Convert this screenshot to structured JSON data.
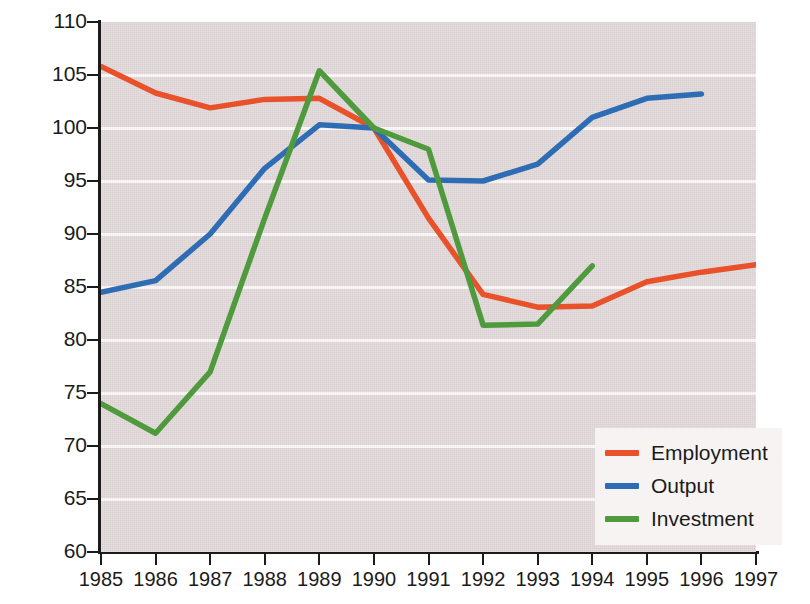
{
  "chart_data": {
    "type": "line",
    "title": "",
    "subtitle": "",
    "xlabel": "",
    "ylabel": "1990=100",
    "x": [
      1985,
      1986,
      1987,
      1988,
      1989,
      1990,
      1991,
      1992,
      1993,
      1994,
      1995,
      1996,
      1997
    ],
    "xtick_labels": [
      "1985",
      "1986",
      "1987",
      "1988",
      "1989",
      "1990",
      "1991",
      "1992",
      "1993",
      "1994",
      "1995",
      "1996",
      "1997"
    ],
    "ytick_labels": [
      "110",
      "105",
      "100",
      "95",
      "90",
      "85",
      "80",
      "75",
      "70",
      "65",
      "60"
    ],
    "yticks": [
      110,
      105,
      100,
      95,
      90,
      85,
      80,
      75,
      70,
      65,
      60
    ],
    "ylim": [
      60,
      110
    ],
    "xlim": [
      1985,
      1997
    ],
    "grid": true,
    "grid_axis": "y",
    "legend_position": "bottom-right",
    "plot_background": "#e2dada",
    "gridline_color": "#fbf8f8",
    "series": [
      {
        "name": "Employment",
        "color": "#e8512a",
        "x": [
          1985,
          1986,
          1987,
          1988,
          1989,
          1990,
          1991,
          1992,
          1993,
          1994,
          1995,
          1996,
          1997
        ],
        "values": [
          105.8,
          103.3,
          101.9,
          102.7,
          102.8,
          100.0,
          91.5,
          84.3,
          83.1,
          83.2,
          85.5,
          86.4,
          87.1
        ]
      },
      {
        "name": "Output",
        "color": "#2e6db4",
        "x": [
          1985,
          1986,
          1987,
          1988,
          1989,
          1990,
          1991,
          1992,
          1993,
          1994,
          1995,
          1996
        ],
        "values": [
          84.5,
          85.6,
          90.0,
          96.2,
          100.3,
          100.0,
          95.1,
          95.0,
          96.6,
          101.0,
          102.8,
          103.2
        ]
      },
      {
        "name": "Investment",
        "color": "#4e9a3c",
        "x": [
          1985,
          1986,
          1987,
          1988,
          1989,
          1990,
          1991,
          1992,
          1993,
          1994
        ],
        "values": [
          74.0,
          71.2,
          77.0,
          91.5,
          105.4,
          100.0,
          98.0,
          81.4,
          81.5,
          87.0
        ]
      }
    ]
  },
  "legend": {
    "items": [
      {
        "label": "Employment",
        "color": "#e8512a"
      },
      {
        "label": "Output",
        "color": "#2e6db4"
      },
      {
        "label": "Investment",
        "color": "#4e9a3c"
      }
    ]
  },
  "axis": {
    "y_title": "1990=100"
  }
}
